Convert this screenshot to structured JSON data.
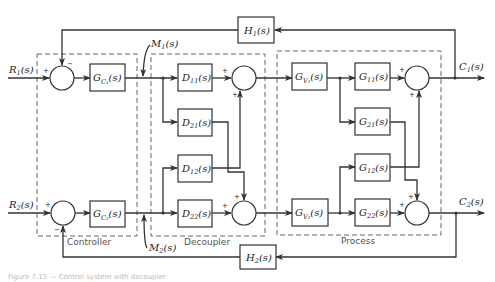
{
  "diagram": {
    "inputs": [
      {
        "label": "R",
        "sub": "1",
        "arg": "(s)"
      },
      {
        "label": "R",
        "sub": "2",
        "arg": "(s)"
      }
    ],
    "outputs": [
      {
        "label": "C",
        "sub": "1",
        "arg": "(s)"
      },
      {
        "label": "C",
        "sub": "2",
        "arg": "(s)"
      }
    ],
    "manipulated": [
      {
        "label": "M",
        "sub": "1",
        "arg": "(s)"
      },
      {
        "label": "M",
        "sub": "2",
        "arg": "(s)"
      }
    ],
    "feedback": [
      {
        "label": "H",
        "sub": "1",
        "arg": "(s)"
      },
      {
        "label": "H",
        "sub": "2",
        "arg": "(s)"
      }
    ],
    "controller": {
      "group_label": "Controller",
      "blocks": [
        {
          "label": "G",
          "sub": "C₁",
          "arg": "(s)"
        },
        {
          "label": "G",
          "sub": "C₂",
          "arg": "(s)"
        }
      ]
    },
    "decoupler": {
      "group_label": "Decoupler",
      "blocks": [
        {
          "label": "D",
          "sub": "11",
          "arg": "(s)"
        },
        {
          "label": "D",
          "sub": "21",
          "arg": "(s)"
        },
        {
          "label": "D",
          "sub": "12",
          "arg": "(s)"
        },
        {
          "label": "D",
          "sub": "22",
          "arg": "(s)"
        }
      ]
    },
    "process": {
      "group_label": "Process",
      "valves": [
        {
          "label": "G",
          "sub": "V₁",
          "arg": "(s)"
        },
        {
          "label": "G",
          "sub": "V₂",
          "arg": "(s)"
        }
      ],
      "blocks": [
        {
          "label": "G",
          "sub": "11",
          "arg": "(s)"
        },
        {
          "label": "G",
          "sub": "21",
          "arg": "(s)"
        },
        {
          "label": "G",
          "sub": "12",
          "arg": "(s)"
        },
        {
          "label": "G",
          "sub": "22",
          "arg": "(s)"
        }
      ]
    },
    "signs": {
      "plus": "+",
      "minus": "−"
    },
    "caption": "Figure 7.15 — Control system with decoupler"
  }
}
